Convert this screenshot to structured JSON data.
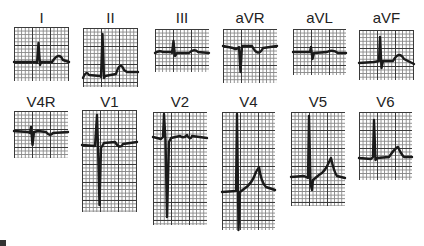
{
  "leads": [
    {
      "id": "I",
      "label": "I"
    },
    {
      "id": "II",
      "label": "II"
    },
    {
      "id": "III",
      "label": "III"
    },
    {
      "id": "aVR",
      "label": "aVR"
    },
    {
      "id": "aVL",
      "label": "aVL"
    },
    {
      "id": "aVF",
      "label": "aVF"
    },
    {
      "id": "V4R",
      "label": "V4R"
    },
    {
      "id": "V1",
      "label": "V1"
    },
    {
      "id": "V2",
      "label": "V2"
    },
    {
      "id": "V4",
      "label": "V4"
    },
    {
      "id": "V5",
      "label": "V5"
    },
    {
      "id": "V6",
      "label": "V6"
    }
  ],
  "colors": {
    "grid_major": "#3a3a3a",
    "grid_minor": "#888888",
    "trace": "#1a1a1a",
    "background": "#ffffff"
  }
}
